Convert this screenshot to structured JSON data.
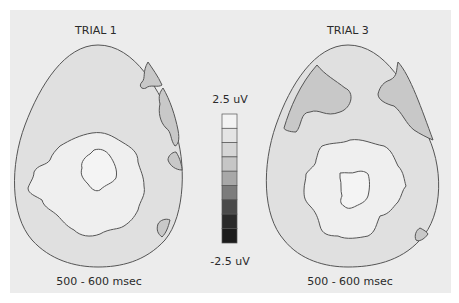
{
  "figure": {
    "maps": [
      {
        "title": "TRIAL 1",
        "time_window": "500 - 600 msec"
      },
      {
        "title": "TRIAL 3",
        "time_window": "500 - 600 msec"
      }
    ],
    "colorbar": {
      "max_label": "2.5 uV",
      "min_label": "-2.5 uV",
      "segments": [
        "#f3f3f3",
        "#e4e4e4",
        "#d6d6d6",
        "#c6c6c6",
        "#a8a8a8",
        "#7c7c7c",
        "#4a4a4a",
        "#2a2a2a",
        "#1c1c1c"
      ]
    },
    "colors": {
      "panel_bg": "#ececec",
      "head_fill": "#e0e0e0",
      "positive_region": "#efefef",
      "negative_region": "#c8c8c8",
      "contour": "#555555"
    }
  }
}
